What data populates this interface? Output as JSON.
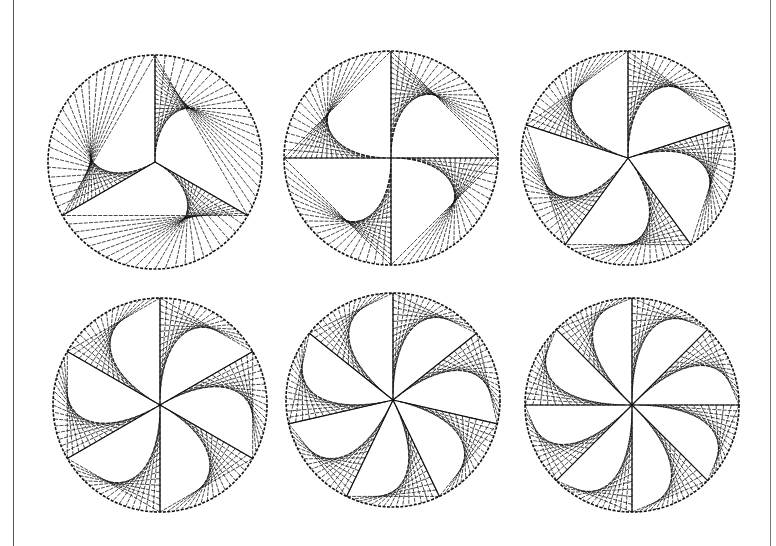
{
  "figure": {
    "ink_color": "#111111",
    "background": "#ffffff",
    "panels": [
      {
        "name": "pattern-3-fold",
        "arms": 3,
        "cx": 155,
        "cy": 162,
        "r": 107,
        "start_angle_deg": -90,
        "lines": 22
      },
      {
        "name": "pattern-4-fold",
        "arms": 4,
        "cx": 391,
        "cy": 158,
        "r": 107,
        "start_angle_deg": -90,
        "lines": 20
      },
      {
        "name": "pattern-5-fold",
        "arms": 5,
        "cx": 628,
        "cy": 158,
        "r": 107,
        "start_angle_deg": -90,
        "lines": 18
      },
      {
        "name": "pattern-6-fold",
        "arms": 6,
        "cx": 160,
        "cy": 405,
        "r": 107,
        "start_angle_deg": -90,
        "lines": 16
      },
      {
        "name": "pattern-7-fold",
        "arms": 7,
        "cx": 393,
        "cy": 400,
        "r": 107,
        "start_angle_deg": -90,
        "lines": 15
      },
      {
        "name": "pattern-8-fold",
        "arms": 8,
        "cx": 632,
        "cy": 405,
        "r": 107,
        "start_angle_deg": -90,
        "lines": 14
      }
    ]
  }
}
